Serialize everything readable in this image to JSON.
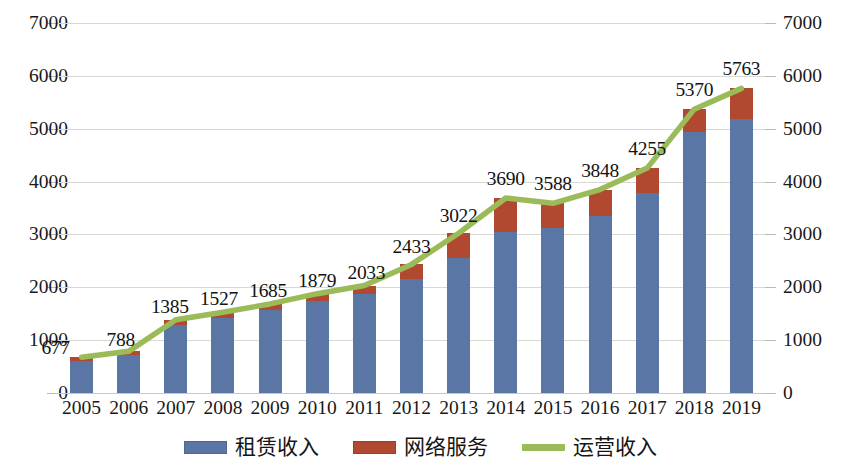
{
  "chart_data": {
    "type": "bar",
    "title": "",
    "subtitle": "",
    "xlabel": "",
    "ylabel": "",
    "ylim": [
      0,
      7000
    ],
    "y_ticks": [
      0,
      1000,
      2000,
      3000,
      4000,
      5000,
      6000,
      7000
    ],
    "grid": true,
    "dual_axis": true,
    "legend_position": "bottom",
    "stacked": true,
    "categories": [
      "2005",
      "2006",
      "2007",
      "2008",
      "2009",
      "2010",
      "2011",
      "2012",
      "2013",
      "2014",
      "2015",
      "2016",
      "2017",
      "2018",
      "2019"
    ],
    "series": [
      {
        "name": "租赁收入",
        "type": "bar",
        "color": "#5A76A4",
        "values": [
          600,
          712,
          1285,
          1420,
          1565,
          1740,
          1880,
          2150,
          2550,
          3050,
          3120,
          3350,
          3790,
          4940,
          5180
        ]
      },
      {
        "name": "网络服务",
        "type": "bar",
        "color": "#B0492F",
        "values": [
          77,
          76,
          100,
          107,
          120,
          139,
          153,
          283,
          472,
          640,
          468,
          498,
          465,
          430,
          583
        ]
      },
      {
        "name": "运营收入",
        "type": "line",
        "color": "#9BBB59",
        "values": [
          677,
          788,
          1385,
          1527,
          1685,
          1879,
          2033,
          2433,
          3022,
          3690,
          3588,
          3848,
          4255,
          5370,
          5763
        ],
        "data_labels": [
          "677",
          "788",
          "1385",
          "1527",
          "1685",
          "1879",
          "2033",
          "2433",
          "3022",
          "3690",
          "3588",
          "3848",
          "4255",
          "5370",
          "5763"
        ]
      }
    ],
    "axis_left_ticks": [
      "0",
      "1000",
      "2000",
      "3000",
      "4000",
      "5000",
      "6000",
      "7000"
    ],
    "axis_right_ticks": [
      "0",
      "1000",
      "2000",
      "3000",
      "4000",
      "5000",
      "6000",
      "7000"
    ]
  },
  "legend": {
    "items": [
      {
        "label": "租赁收入",
        "color": "#5A76A4",
        "kind": "box"
      },
      {
        "label": "网络服务",
        "color": "#B0492F",
        "kind": "box"
      },
      {
        "label": "运营收入",
        "color": "#9BBB59",
        "kind": "line"
      }
    ]
  },
  "colors": {
    "rental": "#5A76A4",
    "network": "#B0492F",
    "operating_line": "#9BBB59",
    "gridline": "#d9d9d4",
    "text": "#181818",
    "background": "#ffffff"
  }
}
